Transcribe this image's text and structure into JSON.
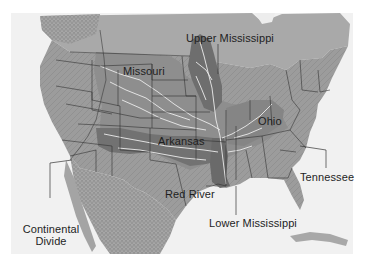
{
  "map": {
    "title": "Mississippi River drainage basin",
    "style": "grayscale shaded relief",
    "colors": {
      "ocean": "#f2f2f2",
      "land": "#9a9a9a",
      "canada_land": "#a8a8a8",
      "mexico_land": "#a2a2a2",
      "basin_light": "#8c8c8c",
      "basin_dark": "#6f6f6f",
      "rivers": "#e8e8e8",
      "borders": "#2a2a2a",
      "label_text": "#1e1e1e"
    },
    "labels": {
      "missouri": "Missouri",
      "upper_mississippi": "Upper Mississippi",
      "ohio": "Ohio",
      "arkansas": "Arkansas",
      "red_river": "Red River",
      "tennessee": "Tennessee",
      "lower_mississippi": "Lower Mississippi",
      "continental_divide_line1": "Continental",
      "continental_divide_line2": "Divide"
    }
  }
}
